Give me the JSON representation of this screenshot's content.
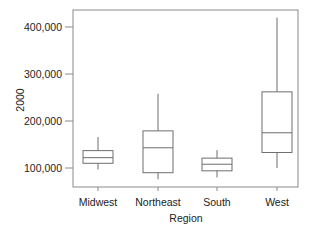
{
  "chart_data": {
    "type": "box",
    "title": "",
    "xlabel": "Region",
    "ylabel": "2000",
    "categories": [
      "Midwest",
      "Northeast",
      "South",
      "West"
    ],
    "yticks": [
      100000,
      200000,
      300000,
      400000
    ],
    "ytick_labels": [
      "100,000",
      "200,000",
      "300,000",
      "400,000"
    ],
    "ylim": [
      57000,
      435000
    ],
    "grid": false,
    "legend": null,
    "series": [
      {
        "name": "Midwest",
        "min": 97000,
        "q1": 110000,
        "median": 122000,
        "q3": 137000,
        "max": 166000
      },
      {
        "name": "Northeast",
        "min": 76000,
        "q1": 90000,
        "median": 143000,
        "q3": 179000,
        "max": 258000
      },
      {
        "name": "South",
        "min": 80000,
        "q1": 94000,
        "median": 108000,
        "q3": 121000,
        "max": 138000
      },
      {
        "name": "West",
        "min": 100000,
        "q1": 133000,
        "median": 175000,
        "q3": 262000,
        "max": 420000
      }
    ]
  },
  "colors": {
    "frame": "#8a8a8a",
    "box": "#6e6e6e",
    "text": "#222222",
    "background": "#ffffff"
  }
}
